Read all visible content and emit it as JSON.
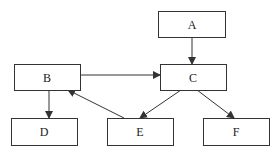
{
  "diagram": {
    "nodes": [
      {
        "id": "A",
        "label": "A",
        "x": 158,
        "y": 11,
        "w": 67,
        "h": 26
      },
      {
        "id": "B",
        "label": "B",
        "x": 14,
        "y": 64,
        "w": 66,
        "h": 26
      },
      {
        "id": "C",
        "label": "C",
        "x": 160,
        "y": 64,
        "w": 66,
        "h": 26
      },
      {
        "id": "D",
        "label": "D",
        "x": 11,
        "y": 118,
        "w": 66,
        "h": 27
      },
      {
        "id": "E",
        "label": "E",
        "x": 107,
        "y": 118,
        "w": 66,
        "h": 27
      },
      {
        "id": "F",
        "label": "F",
        "x": 203,
        "y": 118,
        "w": 66,
        "h": 27
      }
    ],
    "edges": [
      {
        "from": "A",
        "to": "C"
      },
      {
        "from": "B",
        "to": "C"
      },
      {
        "from": "B",
        "to": "D"
      },
      {
        "from": "E",
        "to": "B"
      },
      {
        "from": "C",
        "to": "E"
      },
      {
        "from": "C",
        "to": "F"
      }
    ],
    "caption": ""
  }
}
